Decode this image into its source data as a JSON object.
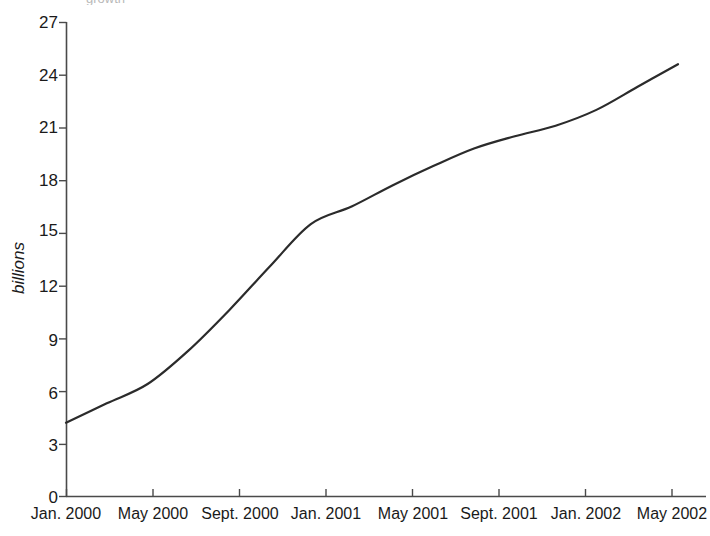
{
  "figure": {
    "clipped_top_text": "growth",
    "background_color": "#ffffff",
    "line_color": "#2b2b2b",
    "axis_color": "#4a4a4a"
  },
  "chart_data": {
    "type": "line",
    "title": "",
    "subtitle": "",
    "xlabel": "",
    "ylabel": "billions",
    "x": [
      "Jan. 2000",
      "May 2000",
      "Sept. 2000",
      "Jan. 2001",
      "May 2001",
      "Sept. 2001",
      "Jan. 2002",
      "May 2002"
    ],
    "categories": [
      "Jan. 2000",
      "May 2000",
      "Sept. 2000",
      "Jan. 2001",
      "May 2001",
      "Sept. 2001",
      "Jan. 2002",
      "May 2002"
    ],
    "values": [
      4.2,
      6.4,
      10.6,
      16.5,
      18.8,
      20.5,
      22.0,
      24.6
    ],
    "series": [
      {
        "name": "billions",
        "values": [
          4.2,
          6.4,
          10.6,
          16.5,
          18.8,
          20.5,
          22.0,
          24.6
        ]
      }
    ],
    "detailed_points": [
      {
        "x": "Jan. 2000",
        "y": 4.2
      },
      {
        "x": "Mar. 2000",
        "y": 5.3
      },
      {
        "x": "May 2000",
        "y": 6.4
      },
      {
        "x": "July 2000",
        "y": 8.3
      },
      {
        "x": "Sept. 2000",
        "y": 10.6
      },
      {
        "x": "Nov. 2000",
        "y": 13.1
      },
      {
        "x": "Dec. 2000",
        "y": 15.5
      },
      {
        "x": "Jan. 2001",
        "y": 16.5
      },
      {
        "x": "Mar. 2001",
        "y": 17.7
      },
      {
        "x": "May 2001",
        "y": 18.8
      },
      {
        "x": "July 2001",
        "y": 19.8
      },
      {
        "x": "Sept. 2001",
        "y": 20.5
      },
      {
        "x": "Nov. 2001",
        "y": 21.1
      },
      {
        "x": "Jan. 2002",
        "y": 22.0
      },
      {
        "x": "Mar. 2002",
        "y": 23.3
      },
      {
        "x": "May 2002",
        "y": 24.6
      }
    ],
    "ylim": [
      0,
      27
    ],
    "yticks": [
      0,
      3,
      6,
      9,
      12,
      15,
      18,
      21,
      24,
      27
    ],
    "ytick_labels": [
      "0",
      "3",
      "6",
      "9",
      "12",
      "15",
      "18",
      "21",
      "24",
      "27"
    ],
    "xtick_labels": [
      "Jan. 2000",
      "May 2000",
      "Sept. 2000",
      "Jan. 2001",
      "May 2001",
      "Sept. 2001",
      "Jan. 2002",
      "May 2002"
    ],
    "grid": false,
    "legend": false,
    "legend_position": "none",
    "annotations": [
      {
        "text": "steep step increase at Jan. 2001",
        "x": "Jan. 2001"
      }
    ]
  }
}
